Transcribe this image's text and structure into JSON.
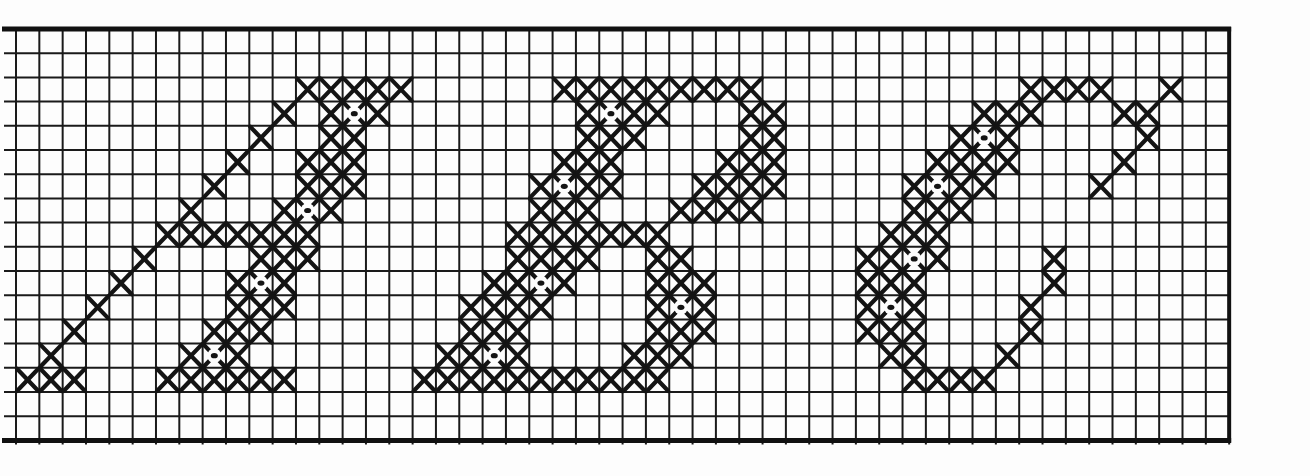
{
  "pattern": {
    "title": "ABC",
    "type": "cross-stitch-chart",
    "letters": [
      "A",
      "B",
      "C"
    ],
    "grid": {
      "columns": 52,
      "rows": 17,
      "origin_x": 16,
      "origin_y": 29,
      "cell_width": 23.33,
      "cell_height": 24.2,
      "line_color": "#1a1a1a",
      "border_color": "#111111",
      "stitch_color": "#141414",
      "background": "#fdfdfd"
    },
    "stitches": {
      "A": [
        [
          2,
          12
        ],
        [
          2,
          13
        ],
        [
          2,
          14
        ],
        [
          2,
          15
        ],
        [
          2,
          16
        ],
        [
          3,
          11
        ],
        [
          3,
          13
        ],
        [
          3,
          14
        ],
        [
          3,
          15
        ],
        [
          4,
          10
        ],
        [
          4,
          13
        ],
        [
          4,
          14
        ],
        [
          5,
          9
        ],
        [
          5,
          12
        ],
        [
          5,
          13
        ],
        [
          5,
          14
        ],
        [
          6,
          8
        ],
        [
          6,
          12
        ],
        [
          6,
          13
        ],
        [
          6,
          14
        ],
        [
          7,
          7
        ],
        [
          7,
          11
        ],
        [
          7,
          12
        ],
        [
          7,
          13
        ],
        [
          8,
          6
        ],
        [
          8,
          7
        ],
        [
          8,
          8
        ],
        [
          8,
          9
        ],
        [
          8,
          10
        ],
        [
          8,
          11
        ],
        [
          8,
          12
        ],
        [
          9,
          5
        ],
        [
          9,
          10
        ],
        [
          9,
          11
        ],
        [
          9,
          12
        ],
        [
          10,
          4
        ],
        [
          10,
          9
        ],
        [
          10,
          10
        ],
        [
          10,
          11
        ],
        [
          11,
          3
        ],
        [
          11,
          9
        ],
        [
          11,
          10
        ],
        [
          11,
          11
        ],
        [
          12,
          2
        ],
        [
          12,
          8
        ],
        [
          12,
          9
        ],
        [
          12,
          10
        ],
        [
          13,
          1
        ],
        [
          13,
          7
        ],
        [
          13,
          8
        ],
        [
          13,
          9
        ],
        [
          14,
          0
        ],
        [
          14,
          1
        ],
        [
          14,
          2
        ],
        [
          14,
          6
        ],
        [
          14,
          7
        ],
        [
          14,
          8
        ],
        [
          14,
          9
        ],
        [
          14,
          10
        ],
        [
          14,
          11
        ]
      ],
      "B": [
        [
          2,
          23
        ],
        [
          2,
          24
        ],
        [
          2,
          25
        ],
        [
          2,
          26
        ],
        [
          2,
          27
        ],
        [
          2,
          28
        ],
        [
          2,
          29
        ],
        [
          2,
          30
        ],
        [
          2,
          31
        ],
        [
          3,
          24
        ],
        [
          3,
          25
        ],
        [
          3,
          26
        ],
        [
          3,
          27
        ],
        [
          3,
          31
        ],
        [
          3,
          32
        ],
        [
          4,
          24
        ],
        [
          4,
          25
        ],
        [
          4,
          26
        ],
        [
          4,
          31
        ],
        [
          4,
          32
        ],
        [
          5,
          23
        ],
        [
          5,
          24
        ],
        [
          5,
          25
        ],
        [
          5,
          30
        ],
        [
          5,
          31
        ],
        [
          5,
          32
        ],
        [
          6,
          22
        ],
        [
          6,
          23
        ],
        [
          6,
          24
        ],
        [
          6,
          25
        ],
        [
          6,
          29
        ],
        [
          6,
          30
        ],
        [
          6,
          31
        ],
        [
          6,
          32
        ],
        [
          7,
          22
        ],
        [
          7,
          23
        ],
        [
          7,
          24
        ],
        [
          7,
          28
        ],
        [
          7,
          29
        ],
        [
          7,
          30
        ],
        [
          7,
          31
        ],
        [
          8,
          21
        ],
        [
          8,
          22
        ],
        [
          8,
          23
        ],
        [
          8,
          24
        ],
        [
          8,
          25
        ],
        [
          8,
          26
        ],
        [
          8,
          27
        ],
        [
          9,
          21
        ],
        [
          9,
          22
        ],
        [
          9,
          23
        ],
        [
          9,
          24
        ],
        [
          9,
          27
        ],
        [
          9,
          28
        ],
        [
          10,
          20
        ],
        [
          10,
          21
        ],
        [
          10,
          22
        ],
        [
          10,
          23
        ],
        [
          10,
          27
        ],
        [
          10,
          28
        ],
        [
          10,
          29
        ],
        [
          11,
          19
        ],
        [
          11,
          20
        ],
        [
          11,
          21
        ],
        [
          11,
          22
        ],
        [
          11,
          27
        ],
        [
          11,
          28
        ],
        [
          11,
          29
        ],
        [
          12,
          19
        ],
        [
          12,
          20
        ],
        [
          12,
          21
        ],
        [
          12,
          27
        ],
        [
          12,
          28
        ],
        [
          12,
          29
        ],
        [
          13,
          18
        ],
        [
          13,
          19
        ],
        [
          13,
          20
        ],
        [
          13,
          21
        ],
        [
          13,
          26
        ],
        [
          13,
          27
        ],
        [
          13,
          28
        ],
        [
          14,
          17
        ],
        [
          14,
          18
        ],
        [
          14,
          19
        ],
        [
          14,
          20
        ],
        [
          14,
          21
        ],
        [
          14,
          22
        ],
        [
          14,
          23
        ],
        [
          14,
          24
        ],
        [
          14,
          25
        ],
        [
          14,
          26
        ],
        [
          14,
          27
        ]
      ],
      "C": [
        [
          2,
          43
        ],
        [
          2,
          44
        ],
        [
          2,
          45
        ],
        [
          2,
          46
        ],
        [
          2,
          49
        ],
        [
          3,
          41
        ],
        [
          3,
          42
        ],
        [
          3,
          43
        ],
        [
          3,
          47
        ],
        [
          3,
          48
        ],
        [
          4,
          40
        ],
        [
          4,
          41
        ],
        [
          4,
          42
        ],
        [
          4,
          48
        ],
        [
          5,
          39
        ],
        [
          5,
          40
        ],
        [
          5,
          41
        ],
        [
          5,
          42
        ],
        [
          5,
          47
        ],
        [
          6,
          38
        ],
        [
          6,
          39
        ],
        [
          6,
          40
        ],
        [
          6,
          41
        ],
        [
          6,
          46
        ],
        [
          7,
          38
        ],
        [
          7,
          39
        ],
        [
          7,
          40
        ],
        [
          8,
          37
        ],
        [
          8,
          38
        ],
        [
          8,
          39
        ],
        [
          9,
          36
        ],
        [
          9,
          37
        ],
        [
          9,
          38
        ],
        [
          9,
          39
        ],
        [
          9,
          44
        ],
        [
          10,
          36
        ],
        [
          10,
          37
        ],
        [
          10,
          38
        ],
        [
          10,
          44
        ],
        [
          11,
          36
        ],
        [
          11,
          37
        ],
        [
          11,
          38
        ],
        [
          11,
          43
        ],
        [
          12,
          36
        ],
        [
          12,
          37
        ],
        [
          12,
          38
        ],
        [
          12,
          43
        ],
        [
          13,
          37
        ],
        [
          13,
          38
        ],
        [
          13,
          42
        ],
        [
          14,
          38
        ],
        [
          14,
          39
        ],
        [
          14,
          40
        ],
        [
          14,
          41
        ]
      ]
    },
    "dots": {
      "A": [
        [
          3,
          14
        ],
        [
          7,
          12
        ],
        [
          10,
          10
        ],
        [
          13,
          8
        ]
      ],
      "B": [
        [
          3,
          25
        ],
        [
          6,
          23
        ],
        [
          10,
          22
        ],
        [
          11,
          28
        ],
        [
          13,
          20
        ]
      ],
      "C": [
        [
          4,
          41
        ],
        [
          6,
          39
        ],
        [
          9,
          38
        ],
        [
          11,
          37
        ]
      ]
    }
  }
}
